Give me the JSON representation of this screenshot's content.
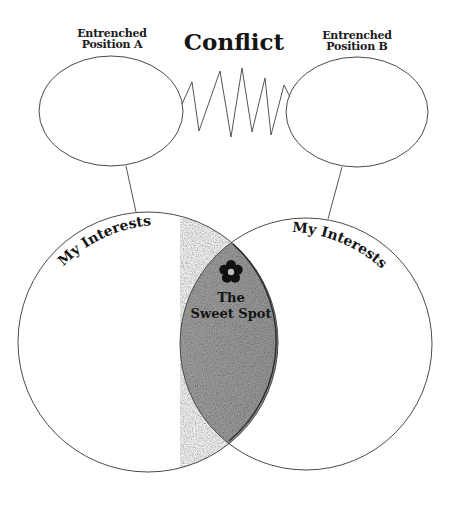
{
  "diagram": {
    "title": "Conflict",
    "positions": [
      {
        "id": "a",
        "label_line1": "Entrenched",
        "label_line2": "Position A"
      },
      {
        "id": "b",
        "label_line1": "Entrenched",
        "label_line2": "Position B"
      }
    ],
    "interests": [
      {
        "id": "left",
        "label": "My Interests"
      },
      {
        "id": "right",
        "label": "My Interests"
      }
    ],
    "overlap": {
      "label_line1": "The",
      "label_line2": "Sweet Spot",
      "icon": "flower-icon",
      "fill_color": "#a3a3a3"
    },
    "connection_between_positions": "zigzag-spring"
  }
}
